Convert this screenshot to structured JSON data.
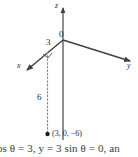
{
  "figure": {
    "type": "3d-coordinate-axes-diagram",
    "axes": [
      {
        "name": "z",
        "label": "z",
        "direction": "up",
        "arrow": true
      },
      {
        "name": "y",
        "label": "y",
        "direction": "right-down",
        "arrow": true
      },
      {
        "name": "x",
        "label": "x",
        "direction": "left-down",
        "arrow": true
      }
    ],
    "origin_label": "0",
    "segment_labels": [
      {
        "name": "x-distance",
        "label": "3"
      },
      {
        "name": "z-drop-distance",
        "label": "6"
      }
    ],
    "point": {
      "label": "(3, 0, −6)",
      "marker": "filled-dot"
    },
    "dashed_line": {
      "style": "dotted",
      "from": "x-axis at distance 3",
      "to": "point (3, 0, −6)"
    },
    "right_angle_marker": true,
    "colors": {
      "axis": "#404040",
      "dotted": "#8a8a8a",
      "text": "#2b2b2b",
      "background": "#ffffff"
    }
  },
  "caption": {
    "formula_text": "cos θ = 3, y = 3 sin θ = 0, an",
    "cropped": true
  }
}
